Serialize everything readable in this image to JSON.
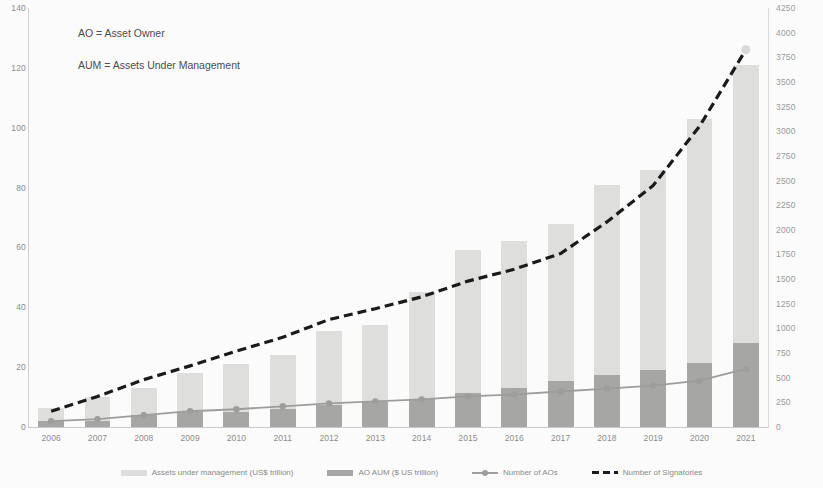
{
  "annotation": {
    "line1": "AO = Asset Owner",
    "line2": "AUM = Assets Under Management"
  },
  "legend": {
    "items": [
      {
        "label": "Assets under management (US$ trillion)",
        "marker": "bar-light",
        "color": "#dededc"
      },
      {
        "label": "AO AUM ($ US trillion)",
        "marker": "bar-dark",
        "color": "#a6a6a4"
      },
      {
        "label": "Number of AOs",
        "marker": "line-marker",
        "color": "#9d9d9d"
      },
      {
        "label": "Number of Signatories",
        "marker": "line-dashed",
        "color": "#1a1a1a"
      }
    ]
  },
  "chart_data": {
    "type": "bar",
    "title": "",
    "subtitle": "",
    "xlabel": "",
    "ylabel": "",
    "y2label": "",
    "grid": false,
    "legend_position": "bottom",
    "categories": [
      "2006",
      "2007",
      "2008",
      "2009",
      "2010",
      "2011",
      "2012",
      "2013",
      "2014",
      "2015",
      "2016",
      "2017",
      "2018",
      "2019",
      "2020",
      "2021"
    ],
    "ylim": [
      0,
      140
    ],
    "yticks": [
      0,
      20,
      40,
      60,
      80,
      100,
      120,
      140
    ],
    "y2lim": [
      0,
      4250
    ],
    "y2ticks": [
      0,
      250,
      500,
      750,
      1000,
      1250,
      1500,
      1750,
      2000,
      2250,
      2500,
      2750,
      3000,
      3250,
      3500,
      3750,
      4000,
      4250
    ],
    "series": [
      {
        "name": "Assets under management (US$ trillion)",
        "type": "bar",
        "axis": "left",
        "color": "#dededc",
        "values": [
          6.5,
          10,
          13,
          18,
          21,
          24,
          32,
          34,
          45,
          59,
          62,
          68,
          81,
          86,
          103,
          121
        ]
      },
      {
        "name": "AO AUM ($ US trillion)",
        "type": "bar",
        "axis": "left",
        "color": "#a6a6a4",
        "values": [
          2,
          2,
          4,
          5,
          5,
          6,
          7.5,
          8.5,
          9.5,
          11.5,
          13,
          15.5,
          17.5,
          19,
          21.5,
          28
        ]
      },
      {
        "name": "Number of AOs",
        "type": "line",
        "axis": "right",
        "color": "#9d9d9d",
        "values": [
          60,
          80,
          120,
          160,
          180,
          210,
          240,
          260,
          280,
          310,
          330,
          360,
          390,
          420,
          470,
          590
        ]
      },
      {
        "name": "Number of Signatories",
        "type": "line-dashed",
        "axis": "right",
        "color": "#1a1a1a",
        "values": [
          160,
          310,
          480,
          620,
          770,
          910,
          1090,
          1200,
          1320,
          1480,
          1600,
          1760,
          2080,
          2450,
          3050,
          3826
        ]
      }
    ]
  }
}
